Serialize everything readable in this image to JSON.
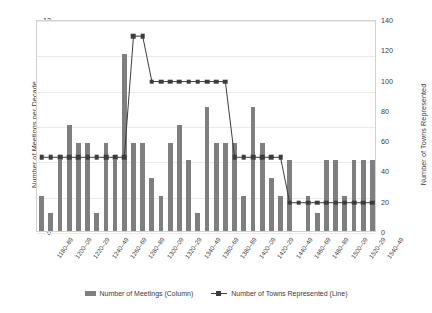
{
  "chart_data": {
    "type": "bar",
    "title": "",
    "xlabel": "",
    "ylabel": "Number of Meetings per Decade",
    "y2label": "Number of Towns Represented",
    "ylim": [
      0,
      12
    ],
    "y2lim": [
      0,
      140
    ],
    "yticks": [
      0,
      2,
      4,
      6,
      8,
      10,
      12
    ],
    "y2ticks": [
      0,
      20,
      40,
      60,
      80,
      100,
      120,
      140
    ],
    "grid": true,
    "legend_position": "bottom",
    "categories": [
      "1180–89",
      "1190–99",
      "1200–09",
      "1210–19",
      "1220–29",
      "1230–39",
      "1240–49",
      "1250–59",
      "1260–69",
      "1270–79",
      "1280–89",
      "1290–99",
      "1300–09",
      "1310–19",
      "1320–29",
      "1330–39",
      "1340–49",
      "1350–59",
      "1360–69",
      "1370–79",
      "1380–89",
      "1390–99",
      "1400–09",
      "1410–19",
      "1420–29",
      "1430–39",
      "1440–49",
      "1450–59",
      "1460–69",
      "1470–79",
      "1480–89",
      "1490–99",
      "1500–09",
      "1510–19",
      "1520–29",
      "1530–39",
      "1540–49"
    ],
    "xtick_labels_shown": [
      "1180–89",
      "1200–09",
      "1220–29",
      "1240–49",
      "1260–69",
      "1280–89",
      "1300–09",
      "1320–29",
      "1340–49",
      "1360–69",
      "1380–89",
      "1400–09",
      "1420–29",
      "1440–49",
      "1460–69",
      "1480–89",
      "1500–09",
      "1520–29",
      "1540–49"
    ],
    "series": [
      {
        "name": "Number of Meetings (Column)",
        "type": "bar",
        "axis": "left",
        "color": "#7f7f7f",
        "values": [
          2,
          1,
          4,
          6,
          5,
          5,
          1,
          5,
          4,
          10,
          5,
          5,
          3,
          2,
          5,
          6,
          4,
          1,
          7,
          5,
          5,
          5,
          2,
          7,
          5,
          3,
          2,
          4,
          0,
          2,
          1,
          4,
          4,
          2,
          4,
          4,
          4
        ]
      },
      {
        "name": "Number of Towns Represented (Line)",
        "type": "line",
        "axis": "right",
        "color": "#3c3c3c",
        "marker": "square",
        "values": [
          50,
          50,
          50,
          50,
          50,
          50,
          50,
          50,
          50,
          50,
          130,
          130,
          100,
          100,
          100,
          100,
          100,
          100,
          100,
          100,
          100,
          50,
          50,
          50,
          50,
          50,
          50,
          20,
          20,
          20,
          20,
          20,
          20,
          20,
          20,
          20,
          20
        ]
      }
    ]
  },
  "legend": {
    "items": [
      {
        "label": "Number of Meetings (Column)",
        "marker": "column-swatch"
      },
      {
        "label": "Number of Towns Represented (Line)",
        "marker": "line-swatch"
      }
    ]
  }
}
